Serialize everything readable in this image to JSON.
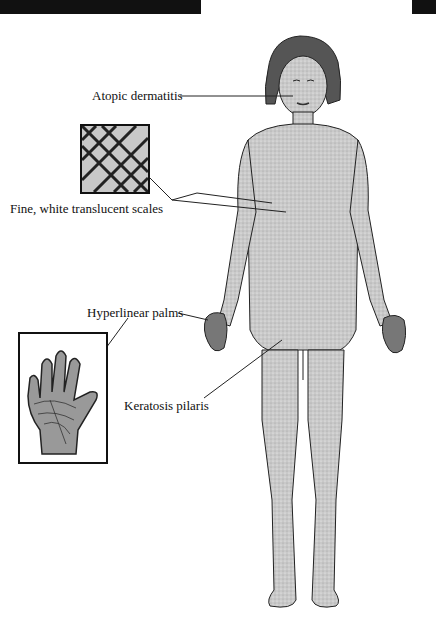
{
  "figure": {
    "labels": {
      "atopic": "Atopic dermatitis",
      "scales": "Fine, white translucent scales",
      "palms": "Hyperlinear palms",
      "keratosis": "Keratosis pilaris"
    },
    "insets": [
      {
        "name": "scales-inset",
        "depicts": "fish-scale skin pattern"
      },
      {
        "name": "palm-inset",
        "depicts": "hyperlinear palm close-up"
      }
    ],
    "colors": {
      "ink": "#111111",
      "skin": "#cfcfcf",
      "hair": "#555555",
      "background": "#ffffff"
    }
  }
}
